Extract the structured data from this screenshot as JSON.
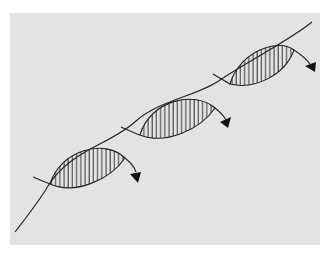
{
  "diagram": {
    "twist_count": 3,
    "hatch_style": "vertical-lines",
    "colors": {
      "background": "#e3e3e3",
      "stroke": "#222222",
      "page": "#ffffff"
    }
  }
}
